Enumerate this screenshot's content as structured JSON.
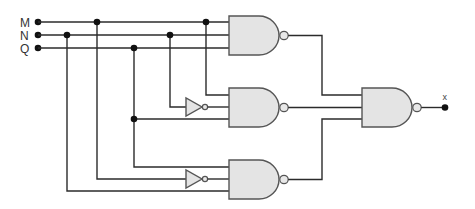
{
  "diagram": {
    "type": "logic-circuit",
    "inputs": [
      {
        "label": "M"
      },
      {
        "label": "N"
      },
      {
        "label": "Q"
      }
    ],
    "output": {
      "label": "x"
    },
    "gates": [
      {
        "id": "nand1",
        "type": "NAND",
        "inputs": [
          "M",
          "N",
          "Q"
        ]
      },
      {
        "id": "not1",
        "type": "NOT",
        "inputs": [
          "N"
        ]
      },
      {
        "id": "nand2",
        "type": "NAND",
        "inputs": [
          "M",
          "not1",
          "Q"
        ]
      },
      {
        "id": "not2",
        "type": "NOT",
        "inputs": [
          "M"
        ]
      },
      {
        "id": "nand3",
        "type": "NAND",
        "inputs": [
          "Q",
          "not2",
          "N"
        ]
      },
      {
        "id": "nand4",
        "type": "NAND",
        "inputs": [
          "nand1",
          "nand2",
          "nand3"
        ],
        "output": "x"
      }
    ],
    "colors": {
      "wire": "#2b2b2b",
      "gate_fill": "#e4e4e4",
      "gate_stroke": "#555555",
      "junction": "#111111"
    }
  }
}
